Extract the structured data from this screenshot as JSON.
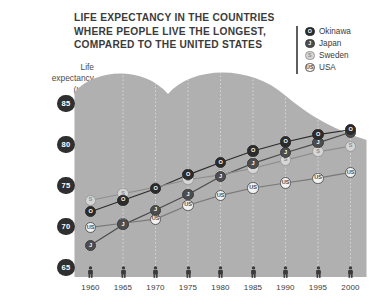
{
  "title": {
    "line1": "LIFE EXPECTANCY IN THE COUNTRIES",
    "line2": "WHERE PEOPLE LIVE THE LONGEST,",
    "line3": "COMPARED TO THE UNITED STATES"
  },
  "axis": {
    "y_title_line1": "Life",
    "y_title_line2": "expectancy",
    "y_title_line3": "(L.E.)"
  },
  "legend": {
    "position": "top-right",
    "items": [
      {
        "label": "Okinawa",
        "marker": "O",
        "color": "#2b2b2b",
        "key": "okinawa"
      },
      {
        "label": "Japan",
        "marker": "J",
        "color": "#4d4d4d",
        "key": "japan"
      },
      {
        "label": "Sweden",
        "marker": "S",
        "color": "#d6d6d6",
        "key": "sweden"
      },
      {
        "label": "USA",
        "marker": "US",
        "color": "#f2f2f2",
        "key": "usa"
      }
    ]
  },
  "chart_data": {
    "type": "line",
    "title": "LIFE EXPECTANCY IN THE COUNTRIES WHERE PEOPLE LIVE THE LONGEST, COMPARED TO THE UNITED STATES",
    "xlabel": "",
    "ylabel": "Life expectancy (L.E.)",
    "x": [
      1960,
      1965,
      1970,
      1975,
      1980,
      1985,
      1990,
      1995,
      2000
    ],
    "xtick_labels": [
      "1960",
      "1965",
      "1970",
      "1975",
      "1980",
      "1985",
      "1990",
      "1995",
      "2000"
    ],
    "ytick_labels": [
      "85",
      "80",
      "75",
      "70",
      "65"
    ],
    "ytick_values": [
      85,
      80,
      75,
      70,
      65
    ],
    "xlim": [
      1958,
      2002
    ],
    "ylim": [
      63.5,
      86.5
    ],
    "grid": "vertical-dotted",
    "legend_position": "top-right",
    "series": [
      {
        "name": "Okinawa",
        "marker": "O",
        "color": "#2b2b2b",
        "values": [
          71.8,
          73.2,
          74.6,
          76.3,
          77.8,
          79.2,
          80.3,
          81.2,
          81.8
        ]
      },
      {
        "name": "Japan",
        "marker": "J",
        "color": "#4d4d4d",
        "values": [
          67.7,
          70.2,
          72.0,
          73.9,
          76.1,
          77.7,
          79.0,
          80.2,
          81.5
        ]
      },
      {
        "name": "Sweden",
        "marker": "S",
        "color": "#d6d6d6",
        "values": [
          73.2,
          74.0,
          74.8,
          75.7,
          76.3,
          77.1,
          78.1,
          79.1,
          79.8
        ]
      },
      {
        "name": "USA",
        "marker": "US",
        "color": "#f2f2f2",
        "values": [
          69.9,
          70.4,
          70.9,
          72.6,
          73.8,
          74.7,
          75.3,
          75.9,
          76.6
        ]
      }
    ]
  }
}
